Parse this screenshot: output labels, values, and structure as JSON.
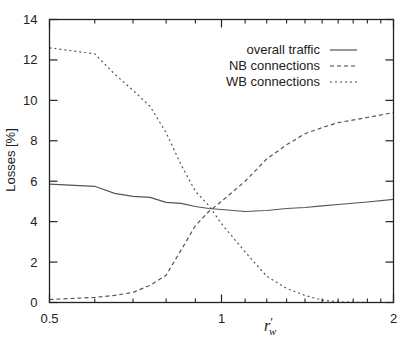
{
  "chart_data": {
    "type": "line",
    "title": "",
    "xlabel": "r'_w",
    "xlabel_main": "r",
    "xlabel_prime": "′",
    "xlabel_sub": "w",
    "ylabel": "Losses [%]",
    "xscale": "log",
    "xlim": [
      0.5,
      2
    ],
    "ylim": [
      0,
      14
    ],
    "grid": false,
    "legend_position": "upper right",
    "x_tick_labels": [
      "0.5",
      "1",
      "2"
    ],
    "x_ticks_major": [
      0.5,
      1,
      2
    ],
    "x_ticks_minor": [
      0.6,
      0.7,
      0.8,
      0.9,
      1.1,
      1.2,
      1.3,
      1.4,
      1.5,
      1.6,
      1.7,
      1.8,
      1.9
    ],
    "y_ticks": [
      0,
      2,
      4,
      6,
      8,
      10,
      12,
      14
    ],
    "y_tick_labels": [
      "0",
      "2",
      "4",
      "6",
      "8",
      "10",
      "12",
      "14"
    ],
    "x": [
      0.5,
      0.6,
      0.65,
      0.7,
      0.75,
      0.8,
      0.85,
      0.9,
      0.95,
      1.0,
      1.1,
      1.2,
      1.3,
      1.4,
      1.5,
      1.6,
      1.8,
      2.0
    ],
    "series": [
      {
        "name": "overall traffic",
        "style": "solid",
        "values": [
          5.85,
          5.75,
          5.4,
          5.25,
          5.2,
          4.95,
          4.9,
          4.75,
          4.65,
          4.6,
          4.5,
          4.55,
          4.65,
          4.7,
          4.78,
          4.85,
          4.97,
          5.1
        ]
      },
      {
        "name": "NB connections",
        "style": "dashed",
        "values": [
          0.15,
          0.25,
          0.35,
          0.5,
          0.85,
          1.35,
          2.6,
          3.8,
          4.5,
          5.0,
          6.0,
          7.1,
          7.8,
          8.35,
          8.65,
          8.9,
          9.15,
          9.4
        ]
      },
      {
        "name": "WB connections",
        "style": "dotted",
        "values": [
          12.6,
          12.3,
          11.3,
          10.5,
          9.7,
          8.4,
          6.8,
          5.5,
          4.8,
          3.9,
          2.5,
          1.3,
          0.7,
          0.35,
          0.12,
          0.03,
          0.0,
          0.0
        ]
      }
    ]
  },
  "colors": {
    "axis": "#222222",
    "line": "#555555",
    "background": "#ffffff"
  }
}
